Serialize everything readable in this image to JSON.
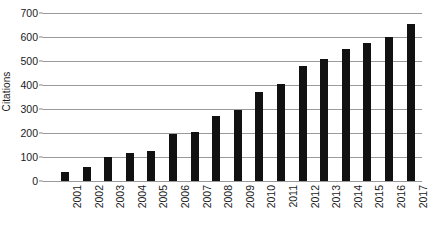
{
  "chart_data": {
    "type": "bar",
    "title": "",
    "xlabel": "",
    "ylabel": "Citations",
    "ylim": [
      0,
      700
    ],
    "ytick_step": 100,
    "grid": true,
    "legend": "none",
    "bar_color": "#111111",
    "gridline_color": "#9a9a9a",
    "background_color": "#ffffff",
    "categories": [
      "2001",
      "2002",
      "2003",
      "2004",
      "2005",
      "2006",
      "2007",
      "2008",
      "2009",
      "2010",
      "2011",
      "2012",
      "2013",
      "2014",
      "2015",
      "2016",
      "2017"
    ],
    "values": [
      37,
      60,
      100,
      115,
      125,
      197,
      203,
      270,
      295,
      370,
      405,
      480,
      510,
      550,
      575,
      600,
      655
    ],
    "ytick_labels": [
      "0",
      "100",
      "200",
      "300",
      "400",
      "500",
      "600",
      "700"
    ],
    "ytick_values": [
      0,
      100,
      200,
      300,
      400,
      500,
      600,
      700
    ]
  }
}
